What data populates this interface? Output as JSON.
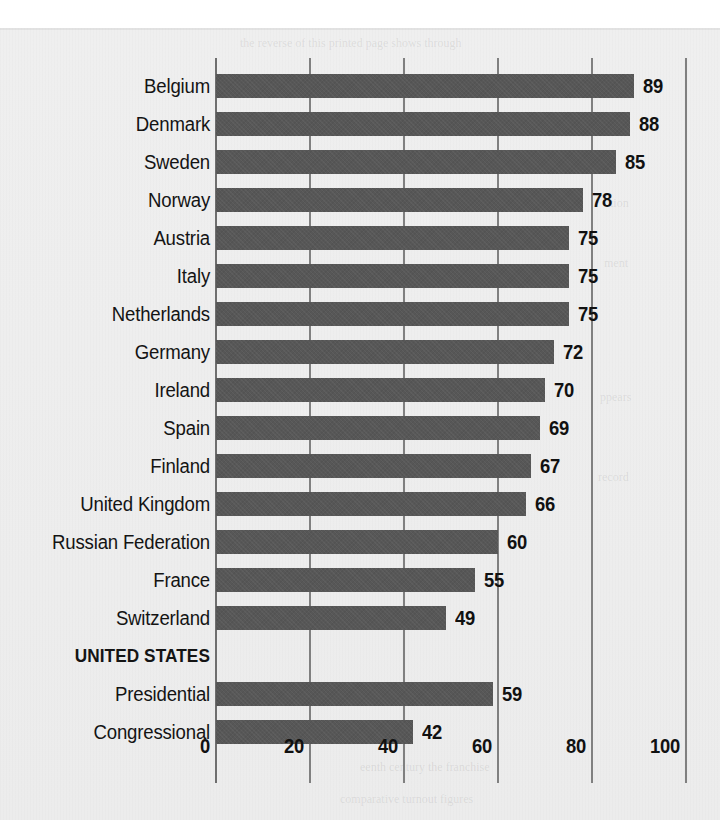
{
  "chart_data": {
    "type": "bar",
    "orientation": "horizontal",
    "title": "",
    "subtitle": "",
    "xlabel": "",
    "ylabel": "",
    "xlim": [
      0,
      100
    ],
    "xticks": [
      0,
      20,
      40,
      60,
      80,
      100
    ],
    "xtick_labels": [
      "0",
      "20",
      "40",
      "60",
      "80",
      "100"
    ],
    "grid": true,
    "grid_axis": "x",
    "legend": false,
    "legend_position": "none",
    "bar_color": "#575757",
    "categories": [
      "Belgium",
      "Denmark",
      "Sweden",
      "Norway",
      "Austria",
      "Italy",
      "Netherlands",
      "Germany",
      "Ireland",
      "Spain",
      "Finland",
      "United Kingdom",
      "Russian Federation",
      "France",
      "Switzerland",
      "UNITED STATES",
      "Presidential",
      "Congressional"
    ],
    "values": [
      89,
      88,
      85,
      78,
      75,
      75,
      75,
      72,
      70,
      69,
      67,
      66,
      60,
      55,
      49,
      null,
      59,
      42
    ],
    "rows": [
      {
        "label": "Belgium",
        "value": 89,
        "value_label": "89",
        "is_group_header": false
      },
      {
        "label": "Denmark",
        "value": 88,
        "value_label": "88",
        "is_group_header": false
      },
      {
        "label": "Sweden",
        "value": 85,
        "value_label": "85",
        "is_group_header": false
      },
      {
        "label": "Norway",
        "value": 78,
        "value_label": "78",
        "is_group_header": false
      },
      {
        "label": "Austria",
        "value": 75,
        "value_label": "75",
        "is_group_header": false
      },
      {
        "label": "Italy",
        "value": 75,
        "value_label": "75",
        "is_group_header": false
      },
      {
        "label": "Netherlands",
        "value": 75,
        "value_label": "75",
        "is_group_header": false
      },
      {
        "label": "Germany",
        "value": 72,
        "value_label": "72",
        "is_group_header": false
      },
      {
        "label": "Ireland",
        "value": 70,
        "value_label": "70",
        "is_group_header": false
      },
      {
        "label": "Spain",
        "value": 69,
        "value_label": "69",
        "is_group_header": false
      },
      {
        "label": "Finland",
        "value": 67,
        "value_label": "67",
        "is_group_header": false
      },
      {
        "label": "United Kingdom",
        "value": 66,
        "value_label": "66",
        "is_group_header": false
      },
      {
        "label": "Russian Federation",
        "value": 60,
        "value_label": "60",
        "is_group_header": false
      },
      {
        "label": "France",
        "value": 55,
        "value_label": "55",
        "is_group_header": false
      },
      {
        "label": "Switzerland",
        "value": 49,
        "value_label": "49",
        "is_group_header": false
      },
      {
        "label": "UNITED STATES",
        "value": null,
        "value_label": "",
        "is_group_header": true
      },
      {
        "label": "Presidential",
        "value": 59,
        "value_label": "59",
        "is_group_header": false
      },
      {
        "label": "Congressional",
        "value": 42,
        "value_label": "42",
        "is_group_header": false
      }
    ]
  }
}
